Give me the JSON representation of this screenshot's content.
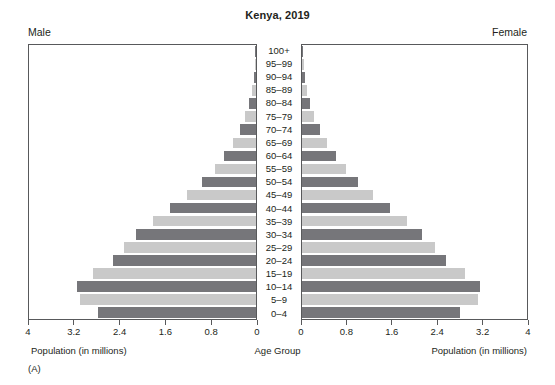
{
  "title": "Kenya, 2019",
  "headers": {
    "left": "Male",
    "right": "Female"
  },
  "captions": {
    "left": "Population (in millions)",
    "center": "Age Group",
    "right": "Population (in millions)",
    "panel_letter": "(A)"
  },
  "colors": {
    "bar_dark": "#76767a",
    "bar_light": "#c9c9c9",
    "frame": "#58595b",
    "text": "#231f20",
    "background": "#ffffff"
  },
  "axis": {
    "left_ticks": [
      "4",
      "3.2",
      "2.4",
      "1.6",
      "0.8",
      "0"
    ],
    "right_ticks": [
      "0",
      "0.8",
      "1.6",
      "2.4",
      "3.2",
      "4"
    ],
    "max": 4,
    "tick_step": 0.8
  },
  "chart_data": {
    "type": "bar",
    "subtype": "population-pyramid",
    "title": "Kenya, 2019",
    "xlabel": "Population (in millions)",
    "ylabel": "Age Group",
    "xlim": [
      0,
      4
    ],
    "xticks": [
      0,
      0.8,
      1.6,
      2.4,
      3.2,
      4
    ],
    "grid": false,
    "legend": "none",
    "categories": [
      "100+",
      "95–99",
      "90–94",
      "85–89",
      "80–84",
      "75–79",
      "70–74",
      "65–69",
      "60–64",
      "55–59",
      "50–54",
      "45–49",
      "40–44",
      "35–39",
      "30–34",
      "25–29",
      "20–24",
      "15–19",
      "10–14",
      "5–9",
      "0–4"
    ],
    "series": [
      {
        "name": "Male",
        "side": "left",
        "values": [
          0.01,
          0.02,
          0.04,
          0.07,
          0.12,
          0.2,
          0.29,
          0.41,
          0.56,
          0.73,
          0.95,
          1.21,
          1.52,
          1.82,
          2.11,
          2.33,
          2.52,
          2.87,
          3.15,
          3.11,
          2.79
        ]
      },
      {
        "name": "Female",
        "side": "right",
        "values": [
          0.01,
          0.03,
          0.05,
          0.08,
          0.14,
          0.22,
          0.32,
          0.44,
          0.6,
          0.78,
          1.0,
          1.26,
          1.57,
          1.86,
          2.14,
          2.36,
          2.56,
          2.9,
          3.17,
          3.13,
          2.8
        ]
      }
    ],
    "bar_colors_alternating": [
      "#c9c9c9",
      "#76767a"
    ],
    "note": "Bars alternate light gray and dark gray by age band; 0–4 band is dark gray."
  }
}
